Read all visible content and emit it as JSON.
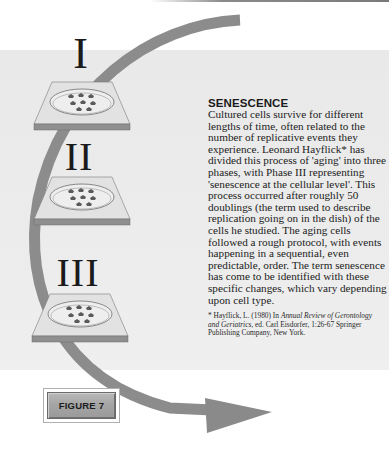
{
  "figure": {
    "label": "FIGURE 7"
  },
  "phases": [
    {
      "numeral": "I",
      "dish_icon": "petri-dish-icon",
      "cell_count": 8
    },
    {
      "numeral": "II",
      "dish_icon": "petri-dish-icon",
      "cell_count": 8
    },
    {
      "numeral": "III",
      "dish_icon": "petri-dish-icon",
      "cell_count": 8
    }
  ],
  "arrow": {
    "icon": "curved-arrow-icon",
    "color": "#8c8c8c"
  },
  "article": {
    "heading": "SENESCENCE",
    "body": "Cultured cells survive for different lengths of time, often related to the number of replicative events they experience.  Leonard Hayflick* has divided this process of 'aging' into three phases, with Phase III representing 'senescence at the cellular level'.  This process occurred after roughly 50 doublings (the term used to describe replication going on in the dish) of the cells he studied.  The aging cells followed a rough protocol, with events happening in a sequential, even predictable, order.  The term senescence has come to be identified with these specific changes, which vary depending upon cell type.",
    "footnote": {
      "prefix": "* Hayflick, L. (1980) In ",
      "journal": "Annual Review of Gerontology and Geriatrics",
      "suffix": ", ed. Carl Eisdorfer, 1:26-67  Springer Publishing Company, New York."
    }
  },
  "colors": {
    "band": "#ebebeb",
    "arrow": "#8c8c8c",
    "tray_top": "#dcdcdc",
    "tray_edge": "#8f8f8f",
    "badge": "#a8a8a8"
  }
}
